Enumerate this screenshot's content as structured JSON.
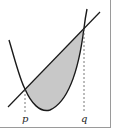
{
  "diagram": {
    "type": "area-between-curves",
    "labels": {
      "left_intersection": "p",
      "right_intersection": "q"
    },
    "colors": {
      "curve": "#1a1a1a",
      "shading": "#c8c8c8",
      "dashed_guides": "#555555",
      "frame": "#9a9a9a"
    },
    "elements": [
      "parabola",
      "line",
      "shaded-region",
      "dashed-guide-p",
      "dashed-guide-q"
    ]
  }
}
